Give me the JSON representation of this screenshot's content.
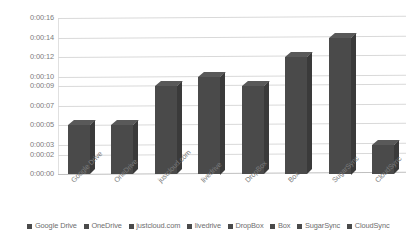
{
  "chart_data": {
    "type": "bar",
    "title": "",
    "xlabel": "",
    "ylabel": "",
    "categories": [
      "Google Drive",
      "OneDrive",
      "justcloud.com",
      "livedrive",
      "DropBox",
      "Box",
      "SugarSync",
      "CloudSync"
    ],
    "values": [
      5,
      5,
      9,
      10,
      9,
      12,
      14,
      3
    ],
    "value_labels": [
      "0:00:05",
      "0:00:05",
      "0:00:09",
      "0:00:10",
      "0:00:09",
      "0:00:12",
      "0:00:14",
      "0:00:03"
    ],
    "ylim": [
      0,
      16
    ],
    "ytick_labels": [
      "0:00:16",
      "0:00:14",
      "0:00:12",
      "0:00:10",
      "0:00:09",
      "0:00:07",
      "0:00:05",
      "0:00:03",
      "0:00:02",
      "0:00:00"
    ],
    "ytick_values": [
      16,
      14,
      12,
      10,
      9,
      7,
      5,
      3,
      2,
      0
    ],
    "grid": true,
    "legend_position": "bottom",
    "series": [
      {
        "name": "upload-time",
        "values": [
          5,
          5,
          9,
          10,
          9,
          12,
          14,
          3
        ]
      }
    ],
    "bar_color": "#4a4a4a",
    "grid_color": "#d9d9d9",
    "text_color": "#7d7d7d"
  },
  "legend": {
    "items": [
      {
        "label": "Google Drive",
        "color": "#4a4a4a"
      },
      {
        "label": "OneDrive",
        "color": "#4a4a4a"
      },
      {
        "label": "justcloud.com",
        "color": "#4a4a4a"
      },
      {
        "label": "livedrive",
        "color": "#4a4a4a"
      },
      {
        "label": "DropBox",
        "color": "#4a4a4a"
      },
      {
        "label": "Box",
        "color": "#4a4a4a"
      },
      {
        "label": "SugarSync",
        "color": "#4a4a4a"
      },
      {
        "label": "CloudSync",
        "color": "#4a4a4a"
      }
    ]
  }
}
